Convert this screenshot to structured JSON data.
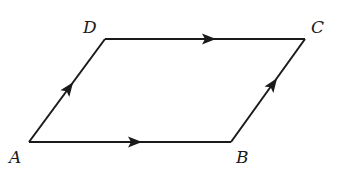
{
  "diagram": {
    "type": "parallelogram-vectors",
    "stroke_color": "#1a1a1a",
    "vertices": {
      "A": {
        "label": "A",
        "x": 29,
        "y": 142,
        "label_x": 9,
        "label_y": 163
      },
      "B": {
        "label": "B",
        "x": 231,
        "y": 142,
        "label_x": 236,
        "label_y": 163
      },
      "C": {
        "label": "C",
        "x": 305,
        "y": 39,
        "label_x": 311,
        "label_y": 33
      },
      "D": {
        "label": "D",
        "x": 105,
        "y": 39,
        "label_x": 83,
        "label_y": 33
      }
    },
    "edges": [
      {
        "from": "A",
        "to": "B",
        "arrow": true,
        "arrow_at": 0.55
      },
      {
        "from": "B",
        "to": "C",
        "arrow": true,
        "arrow_at": 0.55
      },
      {
        "from": "D",
        "to": "C",
        "arrow": true,
        "arrow_at": 0.55
      },
      {
        "from": "A",
        "to": "D",
        "arrow": true,
        "arrow_at": 0.5
      }
    ]
  }
}
